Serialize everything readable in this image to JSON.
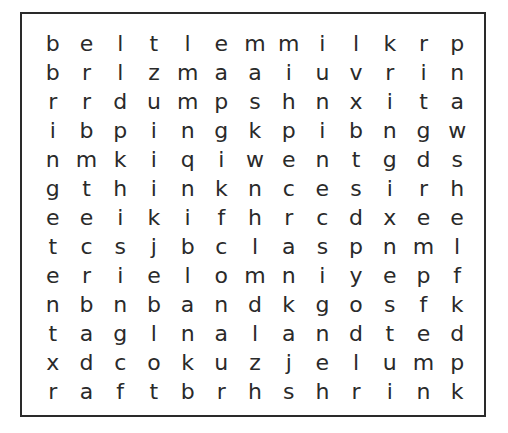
{
  "puzzle": {
    "rows": [
      [
        "b",
        "e",
        "l",
        "t",
        "l",
        "e",
        "m",
        "m",
        "i",
        "l",
        "k",
        "r",
        "p"
      ],
      [
        "b",
        "r",
        "l",
        "z",
        "m",
        "a",
        "a",
        "i",
        "u",
        "v",
        "r",
        "i",
        "n"
      ],
      [
        "r",
        "r",
        "d",
        "u",
        "m",
        "p",
        "s",
        "h",
        "n",
        "x",
        "i",
        "t",
        "a"
      ],
      [
        "i",
        "b",
        "p",
        "i",
        "n",
        "g",
        "k",
        "p",
        "i",
        "b",
        "n",
        "g",
        "w"
      ],
      [
        "n",
        "m",
        "k",
        "i",
        "q",
        "i",
        "w",
        "e",
        "n",
        "t",
        "g",
        "d",
        "s"
      ],
      [
        "g",
        "t",
        "h",
        "i",
        "n",
        "k",
        "n",
        "c",
        "e",
        "s",
        "i",
        "r",
        "h"
      ],
      [
        "e",
        "e",
        "i",
        "k",
        "i",
        "f",
        "h",
        "r",
        "c",
        "d",
        "x",
        "e",
        "e"
      ],
      [
        "t",
        "c",
        "s",
        "j",
        "b",
        "c",
        "l",
        "a",
        "s",
        "p",
        "n",
        "m",
        "l"
      ],
      [
        "e",
        "r",
        "i",
        "e",
        "l",
        "o",
        "m",
        "n",
        "i",
        "y",
        "e",
        "p",
        "f"
      ],
      [
        "n",
        "b",
        "n",
        "b",
        "a",
        "n",
        "d",
        "k",
        "g",
        "o",
        "s",
        "f",
        "k"
      ],
      [
        "t",
        "a",
        "g",
        "l",
        "n",
        "a",
        "l",
        "a",
        "n",
        "d",
        "t",
        "e",
        "d"
      ],
      [
        "x",
        "d",
        "c",
        "o",
        "k",
        "u",
        "z",
        "j",
        "e",
        "l",
        "u",
        "m",
        "p"
      ],
      [
        "r",
        "a",
        "f",
        "t",
        "b",
        "r",
        "h",
        "s",
        "h",
        "r",
        "i",
        "n",
        "k"
      ]
    ]
  }
}
